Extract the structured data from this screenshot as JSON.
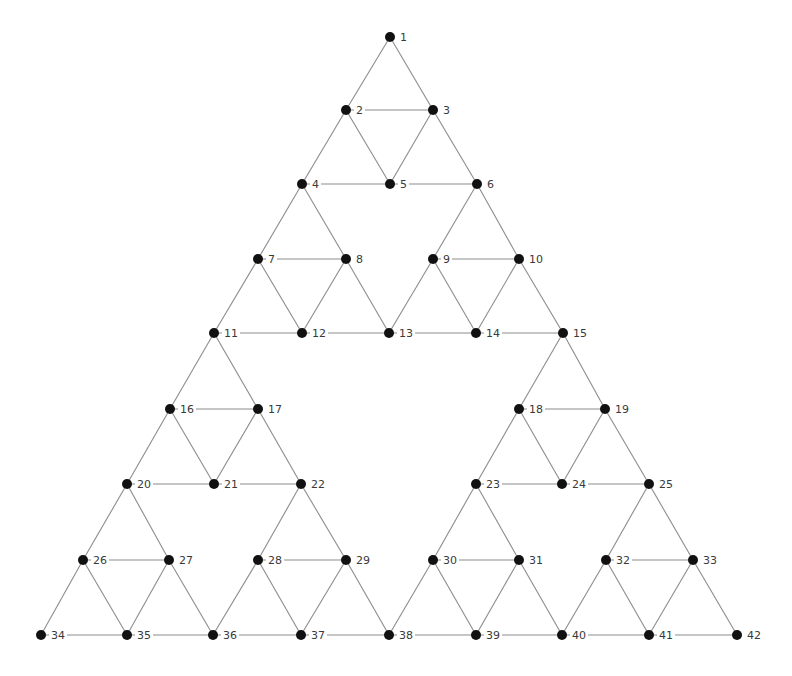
{
  "diagram": {
    "type": "sierpinski-gasket-graph",
    "node_radius": 5,
    "colors": {
      "background": "#ffffff",
      "edge": "#8c8c8c",
      "node": "#111111",
      "label": "#3a3a3a"
    },
    "nodes": [
      {
        "id": 1,
        "label": "1",
        "x": 390,
        "y": 37
      },
      {
        "id": 2,
        "label": "2",
        "x": 346,
        "y": 110
      },
      {
        "id": 3,
        "label": "3",
        "x": 433,
        "y": 110
      },
      {
        "id": 4,
        "label": "4",
        "x": 302,
        "y": 184
      },
      {
        "id": 5,
        "label": "5",
        "x": 390,
        "y": 184
      },
      {
        "id": 6,
        "label": "6",
        "x": 477,
        "y": 184
      },
      {
        "id": 7,
        "label": "7",
        "x": 258,
        "y": 259
      },
      {
        "id": 8,
        "label": "8",
        "x": 346,
        "y": 259
      },
      {
        "id": 9,
        "label": "9",
        "x": 433,
        "y": 259
      },
      {
        "id": 10,
        "label": "10",
        "x": 519,
        "y": 259
      },
      {
        "id": 11,
        "label": "11",
        "x": 214,
        "y": 333
      },
      {
        "id": 12,
        "label": "12",
        "x": 302,
        "y": 333
      },
      {
        "id": 13,
        "label": "13",
        "x": 389,
        "y": 333
      },
      {
        "id": 14,
        "label": "14",
        "x": 476,
        "y": 333
      },
      {
        "id": 15,
        "label": "15",
        "x": 563,
        "y": 333
      },
      {
        "id": 16,
        "label": "16",
        "x": 170,
        "y": 409
      },
      {
        "id": 17,
        "label": "17",
        "x": 258,
        "y": 409
      },
      {
        "id": 18,
        "label": "18",
        "x": 519,
        "y": 409
      },
      {
        "id": 19,
        "label": "19",
        "x": 605,
        "y": 409
      },
      {
        "id": 20,
        "label": "20",
        "x": 127,
        "y": 484
      },
      {
        "id": 21,
        "label": "21",
        "x": 214,
        "y": 484
      },
      {
        "id": 22,
        "label": "22",
        "x": 301,
        "y": 484
      },
      {
        "id": 23,
        "label": "23",
        "x": 476,
        "y": 484
      },
      {
        "id": 24,
        "label": "24",
        "x": 562,
        "y": 484
      },
      {
        "id": 25,
        "label": "25",
        "x": 649,
        "y": 484
      },
      {
        "id": 26,
        "label": "26",
        "x": 83,
        "y": 560
      },
      {
        "id": 27,
        "label": "27",
        "x": 169,
        "y": 560
      },
      {
        "id": 28,
        "label": "28",
        "x": 258,
        "y": 560
      },
      {
        "id": 29,
        "label": "29",
        "x": 346,
        "y": 560
      },
      {
        "id": 30,
        "label": "30",
        "x": 433,
        "y": 560
      },
      {
        "id": 31,
        "label": "31",
        "x": 519,
        "y": 560
      },
      {
        "id": 32,
        "label": "32",
        "x": 606,
        "y": 560
      },
      {
        "id": 33,
        "label": "33",
        "x": 693,
        "y": 560
      },
      {
        "id": 34,
        "label": "34",
        "x": 41,
        "y": 635
      },
      {
        "id": 35,
        "label": "35",
        "x": 127,
        "y": 635
      },
      {
        "id": 36,
        "label": "36",
        "x": 213,
        "y": 635
      },
      {
        "id": 37,
        "label": "37",
        "x": 301,
        "y": 635
      },
      {
        "id": 38,
        "label": "38",
        "x": 389,
        "y": 635
      },
      {
        "id": 39,
        "label": "39",
        "x": 476,
        "y": 635
      },
      {
        "id": 40,
        "label": "40",
        "x": 562,
        "y": 635
      },
      {
        "id": 41,
        "label": "41",
        "x": 649,
        "y": 635
      },
      {
        "id": 42,
        "label": "42",
        "x": 737,
        "y": 635
      }
    ],
    "edges": [
      [
        1,
        2
      ],
      [
        1,
        3
      ],
      [
        2,
        3
      ],
      [
        2,
        4
      ],
      [
        2,
        5
      ],
      [
        3,
        5
      ],
      [
        3,
        6
      ],
      [
        4,
        5
      ],
      [
        5,
        6
      ],
      [
        4,
        7
      ],
      [
        4,
        8
      ],
      [
        7,
        8
      ],
      [
        7,
        11
      ],
      [
        7,
        12
      ],
      [
        8,
        12
      ],
      [
        8,
        13
      ],
      [
        11,
        12
      ],
      [
        12,
        13
      ],
      [
        6,
        9
      ],
      [
        6,
        10
      ],
      [
        9,
        10
      ],
      [
        9,
        13
      ],
      [
        9,
        14
      ],
      [
        10,
        14
      ],
      [
        10,
        15
      ],
      [
        13,
        14
      ],
      [
        14,
        15
      ],
      [
        11,
        16
      ],
      [
        11,
        17
      ],
      [
        16,
        17
      ],
      [
        16,
        20
      ],
      [
        16,
        21
      ],
      [
        17,
        21
      ],
      [
        17,
        22
      ],
      [
        20,
        21
      ],
      [
        21,
        22
      ],
      [
        20,
        26
      ],
      [
        20,
        27
      ],
      [
        26,
        27
      ],
      [
        26,
        34
      ],
      [
        26,
        35
      ],
      [
        27,
        35
      ],
      [
        27,
        36
      ],
      [
        34,
        35
      ],
      [
        35,
        36
      ],
      [
        22,
        28
      ],
      [
        22,
        29
      ],
      [
        28,
        29
      ],
      [
        28,
        36
      ],
      [
        28,
        37
      ],
      [
        29,
        37
      ],
      [
        29,
        38
      ],
      [
        36,
        37
      ],
      [
        37,
        38
      ],
      [
        15,
        18
      ],
      [
        15,
        19
      ],
      [
        18,
        19
      ],
      [
        18,
        23
      ],
      [
        18,
        24
      ],
      [
        19,
        24
      ],
      [
        19,
        25
      ],
      [
        23,
        24
      ],
      [
        24,
        25
      ],
      [
        23,
        30
      ],
      [
        23,
        31
      ],
      [
        30,
        31
      ],
      [
        30,
        38
      ],
      [
        30,
        39
      ],
      [
        31,
        39
      ],
      [
        31,
        40
      ],
      [
        38,
        39
      ],
      [
        39,
        40
      ],
      [
        25,
        32
      ],
      [
        25,
        33
      ],
      [
        32,
        33
      ],
      [
        32,
        40
      ],
      [
        32,
        41
      ],
      [
        33,
        41
      ],
      [
        33,
        42
      ],
      [
        40,
        41
      ],
      [
        41,
        42
      ]
    ]
  }
}
